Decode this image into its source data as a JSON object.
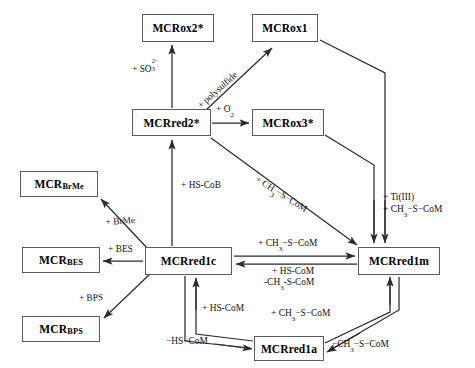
{
  "diagram": {
    "canvas": {
      "width": 475,
      "height": 368
    },
    "line_color": "#2b2b2b",
    "box_border_color": "#5a5a5a",
    "background": "#ffffff",
    "nodes": [
      {
        "id": "mcrox2",
        "label": "MCRox2*",
        "x": 142,
        "y": 14,
        "w": 72,
        "h": 28
      },
      {
        "id": "mcrox1",
        "label": "MCRox1",
        "x": 252,
        "y": 14,
        "w": 66,
        "h": 28
      },
      {
        "id": "mcrred2",
        "label": "MCRred2*",
        "x": 132,
        "y": 109,
        "w": 79,
        "h": 27
      },
      {
        "id": "mcrox3",
        "label": "MCRox3*",
        "x": 252,
        "y": 109,
        "w": 72,
        "h": 27
      },
      {
        "id": "mcrbrme",
        "label": "MCRBrMe",
        "label_main": "MCR",
        "label_sub": "BrMe",
        "x": 20,
        "y": 171,
        "w": 78,
        "h": 26
      },
      {
        "id": "mcrbes",
        "label": "MCRBES",
        "label_main": "MCR",
        "label_sub": "BES",
        "x": 22,
        "y": 247,
        "w": 78,
        "h": 26
      },
      {
        "id": "mcrbps",
        "label": "MCRBPS",
        "label_main": "MCR",
        "label_sub": "BPS",
        "x": 22,
        "y": 316,
        "w": 78,
        "h": 26
      },
      {
        "id": "mcrred1c",
        "label": "MCRred1c",
        "x": 145,
        "y": 247,
        "w": 87,
        "h": 28
      },
      {
        "id": "mcrred1m",
        "label": "MCRred1m",
        "x": 358,
        "y": 247,
        "w": 82,
        "h": 28
      },
      {
        "id": "mcrred1a",
        "label": "MCRred1a",
        "x": 254,
        "y": 336,
        "w": 70,
        "h": 25
      }
    ],
    "edge_labels": [
      {
        "id": "lbl-so3",
        "text": "+ SO3 2-",
        "x": 139,
        "y": 68,
        "rotate": 0
      },
      {
        "id": "lbl-polysulfide",
        "text": "+ polysulfide",
        "x": 200,
        "y": 110,
        "rotate": -41
      },
      {
        "id": "lbl-o2",
        "text": "+ O2",
        "x": 216,
        "y": 106,
        "rotate": 0
      },
      {
        "id": "lbl-ch3scom-diag",
        "text": "+ CH3-S-CoM",
        "x": 258,
        "y": 213,
        "rotate": 31
      },
      {
        "id": "lbl-hscob",
        "text": "+ HS-CoB",
        "x": 182,
        "y": 183,
        "rotate": 0
      },
      {
        "id": "lbl-brme",
        "text": "+ BrMe",
        "x": 107,
        "y": 215,
        "rotate": 0
      },
      {
        "id": "lbl-bes",
        "text": "+ BES",
        "x": 108,
        "y": 246,
        "rotate": 0
      },
      {
        "id": "lbl-bps",
        "text": "+ BPS",
        "x": 80,
        "y": 297,
        "rotate": 0
      },
      {
        "id": "lbl-ti",
        "text": "+ Ti(III)",
        "x": 384,
        "y": 196,
        "rotate": 0
      },
      {
        "id": "lbl-ti-ch3",
        "text": "+ CH3-S-CoM",
        "x": 384,
        "y": 207,
        "rotate": 0
      },
      {
        "id": "lbl-forward-1c1m",
        "text": "+ CH3-S-CoM",
        "x": 275,
        "y": 241,
        "rotate": 0
      },
      {
        "id": "lbl-rev-hscom",
        "text": "+ HS-CoM",
        "x": 284,
        "y": 264,
        "rotate": 0
      },
      {
        "id": "lbl-rev-ch3",
        "text": "-CH3-S-CoM",
        "x": 278,
        "y": 275,
        "rotate": 0
      },
      {
        "id": "lbl-hscom-up",
        "text": "+ HS-CoM",
        "x": 203,
        "y": 306,
        "rotate": 0
      },
      {
        "id": "lbl-hscom-down",
        "text": "-HS-CoM",
        "x": 167,
        "y": 338,
        "rotate": 0
      },
      {
        "id": "lbl-ch3scom-up",
        "text": "+ CH3-S-CoM",
        "x": 273,
        "y": 311,
        "rotate": 0
      },
      {
        "id": "lbl-ch3scom-down",
        "text": "-CH3-S-CoM",
        "x": 337,
        "y": 341,
        "rotate": 0
      }
    ]
  }
}
